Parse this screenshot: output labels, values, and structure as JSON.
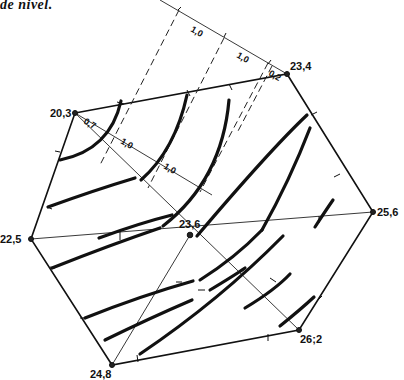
{
  "caption": "de nivel.",
  "vertices": [
    {
      "label": "20,3",
      "x": 75,
      "y": 113
    },
    {
      "label": "23,4",
      "x": 287,
      "y": 74
    },
    {
      "label": "25,6",
      "x": 373,
      "y": 212
    },
    {
      "label": "26;2",
      "x": 299,
      "y": 330
    },
    {
      "label": "24,8",
      "x": 112,
      "y": 365
    },
    {
      "label": "22,5",
      "x": 31,
      "y": 239
    },
    {
      "label": "23,6",
      "x": 190,
      "y": 235
    }
  ],
  "distance_labels": {
    "top_1": "1,0",
    "top_2": "1,0",
    "top_3": "0,2",
    "inner_1": "0,7",
    "inner_2": "1,0",
    "inner_3": "1,0"
  }
}
